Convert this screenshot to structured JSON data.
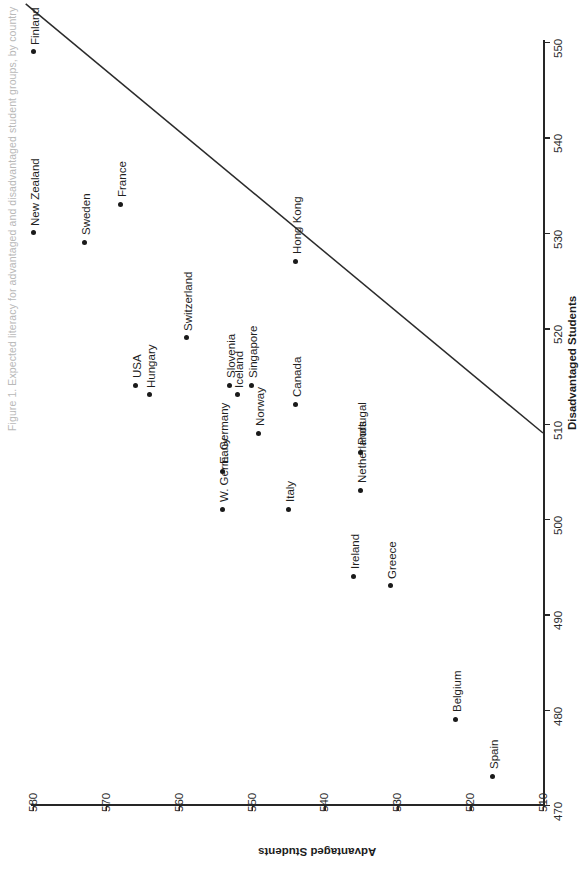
{
  "figure": {
    "title": "Figure 1. Expected literacy for advantaged and disadvantaged student groups, by country"
  },
  "chart_data": {
    "type": "scatter",
    "title": "Figure 1. Expected literacy for advantaged and disadvantaged student groups, by country",
    "xlabel": "Disadvantaged Students",
    "ylabel": "Advantaged Students",
    "xlim": [
      470,
      550
    ],
    "ylim": [
      510,
      580
    ],
    "xticks": [
      470,
      480,
      490,
      500,
      510,
      520,
      530,
      540,
      550
    ],
    "yticks": [
      510,
      520,
      530,
      540,
      550,
      560,
      570,
      580
    ],
    "grid": false,
    "legend": "none",
    "orientation": "rotated-90-ccw",
    "reference_line": {
      "label": "diagonal reference line",
      "x_start": 509,
      "y_start": 510,
      "x_end": 554,
      "y_end": 581
    },
    "points": [
      {
        "label": "Finland",
        "x": 549,
        "y": 580
      },
      {
        "label": "New Zealand",
        "x": 530,
        "y": 580
      },
      {
        "label": "Sweden",
        "x": 529,
        "y": 573
      },
      {
        "label": "France",
        "x": 533,
        "y": 568
      },
      {
        "label": "USA",
        "x": 514,
        "y": 566
      },
      {
        "label": "Hungary",
        "x": 513,
        "y": 564
      },
      {
        "label": "Switzerland",
        "x": 519,
        "y": 559
      },
      {
        "label": "E. Germany",
        "x": 505,
        "y": 554
      },
      {
        "label": "W. Germany",
        "x": 501,
        "y": 554
      },
      {
        "label": "Slovenia",
        "x": 514,
        "y": 553
      },
      {
        "label": "Iceland",
        "x": 513,
        "y": 552
      },
      {
        "label": "Singapore",
        "x": 514,
        "y": 550
      },
      {
        "label": "Norway",
        "x": 509,
        "y": 549
      },
      {
        "label": "Italy",
        "x": 501,
        "y": 545
      },
      {
        "label": "Canada",
        "x": 512,
        "y": 544
      },
      {
        "label": "Portugal",
        "x": 507,
        "y": 535
      },
      {
        "label": "Netherlands",
        "x": 503,
        "y": 535
      },
      {
        "label": "Ireland",
        "x": 494,
        "y": 536
      },
      {
        "label": "Greece",
        "x": 493,
        "y": 531
      },
      {
        "label": "Hong Kong",
        "x": 527,
        "y": 544
      },
      {
        "label": "Belgium",
        "x": 479,
        "y": 522
      },
      {
        "label": "Spain",
        "x": 473,
        "y": 517
      }
    ]
  }
}
